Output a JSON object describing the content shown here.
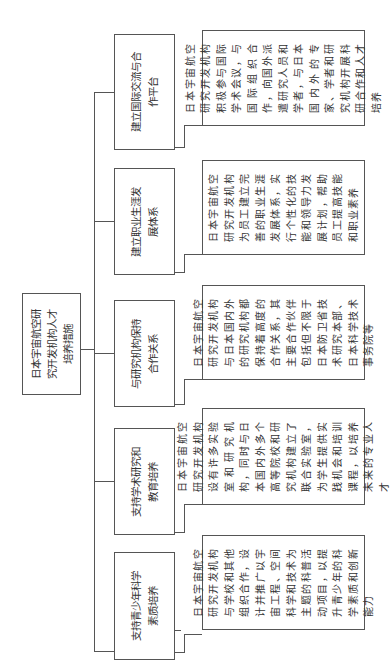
{
  "root": {
    "label": "日本宇宙航空研究开发机构人才培养措施"
  },
  "branches": [
    {
      "label": "支持青少年科学素质培养",
      "detail": "日本宇宙航空研究开发机构与学校和其他组织合作，设计并推广以宇宙工程、空间科学和技术为主题的科普活动项目，以提升青少年的科学素质和创新能力"
    },
    {
      "label": "支持学术研究和教育培养",
      "detail": "日本宇宙航空研究开发机构设有许多实验室和研究机构，同时与日本国内外多个高等院校和研究机构建立了联合实验室，为学生提供实践机会和培训课程，以培养未来的专业人才"
    },
    {
      "label": "与研究机构保持合作关系",
      "detail": "日本宇宙航空研究开发机构与日本国内外的研究机构都保持着高度的合作关系，其主要合作伙伴包括但不限于日本防卫省技术研究本部、日本科学技术事务院等"
    },
    {
      "label": "建立职业生涯发展体系",
      "detail": "日本宇宙航空研究开发机构为员工建立完善的职业生涯发展体系，实行个性化的技能和领导力发展计划，帮助员工提高技能和职业素养"
    },
    {
      "label": "建立国际交流与合作平台",
      "detail": "日本宇宙航空研究开发机构积极参与国际学术会议，与国际组织合作，向国外派遣研究人员和学者，与日本国内外的专家、学者和研究机构开展科研合作和人才培养"
    }
  ]
}
